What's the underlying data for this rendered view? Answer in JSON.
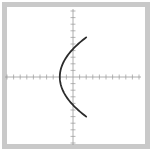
{
  "chart_data": {
    "type": "line",
    "title": "",
    "xlabel": "",
    "ylabel": "",
    "grid": false,
    "legend": null,
    "x_ticks": [
      -10,
      -9,
      -8,
      -7,
      -6,
      -5,
      -4,
      -3,
      -2,
      -1,
      1,
      2,
      3,
      4,
      5,
      6,
      7,
      8,
      9,
      10
    ],
    "y_ticks": [
      -10,
      -9,
      -8,
      -7,
      -6,
      -5,
      -4,
      -3,
      -2,
      -1,
      1,
      2,
      3,
      4,
      5,
      6,
      7,
      8,
      9,
      10
    ],
    "xlim": [
      -10,
      10
    ],
    "ylim": [
      -10,
      10
    ],
    "series": [
      {
        "name": "curve",
        "color": "#2b2b2b",
        "points": [
          {
            "x": 2,
            "y": 6
          },
          {
            "x": 0,
            "y": 4.6
          },
          {
            "x": -1,
            "y": 3.5
          },
          {
            "x": -1.8,
            "y": 2
          },
          {
            "x": -2,
            "y": 0
          },
          {
            "x": -1.8,
            "y": -2
          },
          {
            "x": -1,
            "y": -3.5
          },
          {
            "x": 0,
            "y": -4.6
          },
          {
            "x": 2,
            "y": -6
          }
        ]
      }
    ]
  },
  "style": {
    "frame_color": "#c9c9c9",
    "axis_color": "#9a9a9a",
    "curve_color": "#2b2b2b"
  },
  "caption": ""
}
